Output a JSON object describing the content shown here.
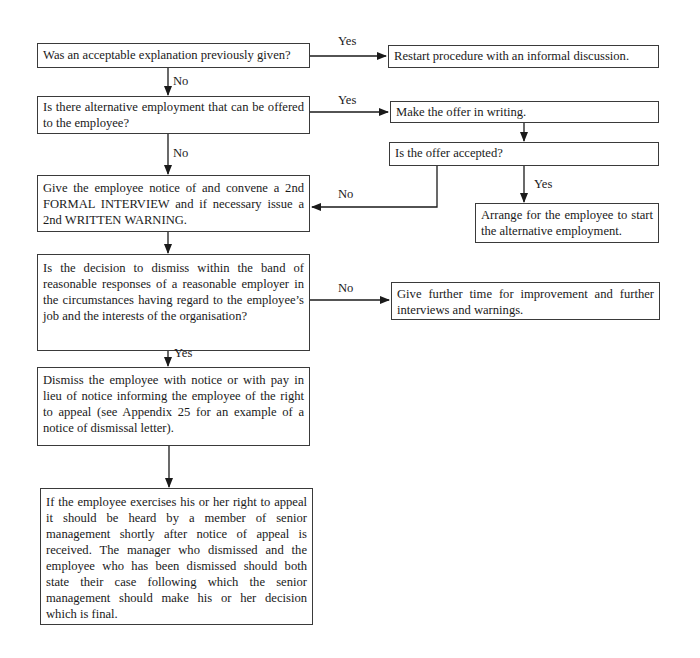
{
  "flowchart": {
    "nodes": {
      "q_explanation": "Was an acceptable explanation previously given?",
      "restart": "Restart procedure with an informal discussion.",
      "q_alternative": "Is there alternative employment that can be offered to the employee?",
      "make_offer": "Make the offer in writing.",
      "q_offer_accepted": "Is the offer accepted?",
      "arrange": "Arrange for the employee to start the alternative employment.",
      "second_interview": "Give the employee notice of and convene a 2nd FORMAL INTERVIEW and if necessary issue a 2nd WRITTEN WARNING.",
      "q_band": "Is the decision to dismiss within the band of reasonable responses of a reasonable employer in the circumstances having regard to the employee’s job and the interests of the organisation?",
      "further_time": "Give further time for improvement and further interviews and warnings.",
      "dismiss": "Dismiss the employee with notice or with pay in lieu of notice informing the employee of the right to appeal (see Appendix 25 for an example of a notice of dismissal letter).",
      "appeal": "If the employee exercises his or her right to appeal it should be heard by a member of senior management shortly after notice of appeal is received. The manager who dismissed and the employee who has been dismissed should both state their case following which the senior management should make his or her decision which is final."
    },
    "edge_labels": {
      "explanation_yes": "Yes",
      "explanation_no": "No",
      "alternative_yes": "Yes",
      "alternative_no": "No",
      "offer_no": "No",
      "offer_yes": "Yes",
      "band_no": "No",
      "band_yes": "Yes"
    },
    "colors": {
      "line": "#1a1a1a",
      "border": "#3a3a3a",
      "background": "#ffffff"
    }
  }
}
